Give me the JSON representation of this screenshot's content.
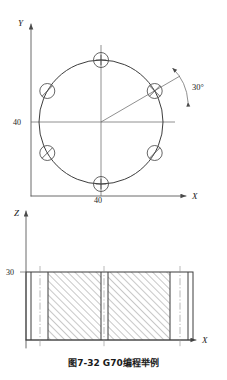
{
  "figure": {
    "caption": "图7-32  G70编程举例",
    "caption_number": "图7-32",
    "caption_title": "G70编程举例",
    "colors": {
      "line": "#5a5a5a",
      "object_line": "#3d3d3d",
      "center_line": "#8a8a8a",
      "text": "#1a1a1a",
      "background": "#ffffff"
    }
  },
  "top_view": {
    "name": "front-view-bolt-circle",
    "axes": {
      "y_label": "Y",
      "x_label": "X"
    },
    "dimensions": [
      {
        "id": "dim-left-40",
        "value": "40",
        "position": "left-of-origin"
      },
      {
        "id": "dim-bottom-40",
        "value": "40",
        "position": "below-bottom-hole"
      }
    ],
    "angle": {
      "value": "30",
      "unit": "°",
      "label": "30°"
    },
    "bolt_circle": {
      "center_x": 101,
      "center_y": 122,
      "radius": 62,
      "hole_radius": 7.5,
      "hole_count": 6,
      "hole_angles_deg": [
        90,
        30,
        -30,
        -90,
        -150,
        150
      ]
    },
    "center_marks": {
      "vertical": true,
      "horizontal": true
    },
    "radial_line_angle_deg": 30
  },
  "bottom_view": {
    "name": "side-section-view",
    "axes": {
      "z_label": "Z",
      "x_label": "X"
    },
    "dimensions": [
      {
        "id": "dim-height-30",
        "value": "30",
        "position": "top-left"
      }
    ],
    "section": {
      "left": 26,
      "right": 193,
      "top": 272,
      "bottom": 340,
      "hatch_angle_deg": 45,
      "hatched_bands": [
        {
          "x_start": 48,
          "x_end": 101
        },
        {
          "x_start": 108,
          "x_end": 170
        }
      ],
      "center_lines_x": [
        40,
        104,
        180
      ]
    }
  }
}
